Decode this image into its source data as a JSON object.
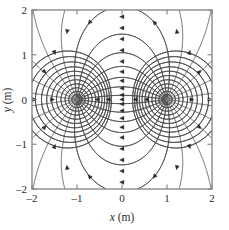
{
  "figure": {
    "type": "field-line-diagram",
    "background_color": "#ffffff",
    "frame_color": "#8a8a8a",
    "field_line_color": "#3a3a3a",
    "equipotential_color": "#4a4a4a",
    "arrow_color": "#2a2a2a",
    "pole_color": "#777777"
  },
  "axes": {
    "x": {
      "title_var": "x",
      "title_unit": "(m)",
      "min": -2,
      "max": 2,
      "ticks": [
        -2,
        -1,
        0,
        1,
        2
      ],
      "tick_labels": [
        "–2",
        "–1",
        "0",
        "1",
        "2"
      ]
    },
    "y": {
      "title_var": "y",
      "title_unit": "(m)",
      "min": -2,
      "max": 2,
      "ticks": [
        -2,
        -1,
        0,
        1,
        2
      ],
      "tick_labels": [
        "–2",
        "–1",
        "0",
        "1",
        "2"
      ]
    }
  },
  "chart_data": {
    "type": "line",
    "title": "",
    "xlabel": "x (m)",
    "ylabel": "y (m)",
    "xlim": [
      -2,
      2
    ],
    "ylim": [
      -2,
      2
    ],
    "grid": false,
    "legend": "none",
    "sources": [
      {
        "name": "left-charge",
        "x": -1.0,
        "y": 0.0,
        "sign": "negative"
      },
      {
        "name": "right-charge",
        "x": 1.0,
        "y": 0.0,
        "sign": "positive"
      }
    ],
    "field_line_count_per_charge": 24,
    "equipotential_ring_radii": [
      0.12,
      0.2,
      0.3,
      0.42,
      0.56,
      0.72,
      0.9,
      1.1,
      1.35,
      1.65,
      2.0
    ],
    "arrow_marker_count": 48,
    "series": [
      {
        "name": "field-lines",
        "style": "solid",
        "width": 0.8
      },
      {
        "name": "equipotentials",
        "style": "solid",
        "width": 0.8
      }
    ]
  }
}
